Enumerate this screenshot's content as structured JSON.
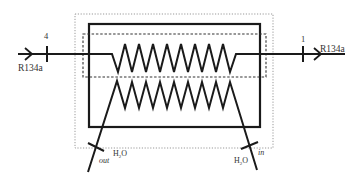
{
  "diagram": {
    "colors": {
      "line": "#1a1a1a",
      "text": "#333333",
      "dotted": "#888888",
      "background": "#ffffff"
    },
    "refrigerant": {
      "inlet_label": "R134a",
      "outlet_label": "R134a",
      "inlet_state": "4",
      "outlet_state": "1"
    },
    "water": {
      "inlet_label_main": "H",
      "inlet_label_sub": "2",
      "inlet_label_tail": "O",
      "inlet_direction": "in",
      "outlet_label_main": "H",
      "outlet_label_sub": "2",
      "outlet_label_tail": "O",
      "outlet_direction": "out"
    }
  }
}
